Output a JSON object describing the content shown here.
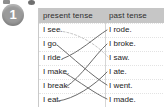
{
  "exercise": {
    "number": "1"
  },
  "table": {
    "columns": [
      {
        "key": "present",
        "label": "present tense"
      },
      {
        "key": "past",
        "label": "past tense"
      }
    ],
    "rows": [
      {
        "present": "I see.",
        "past": "I rode."
      },
      {
        "present": "I go.",
        "past": "I broke."
      },
      {
        "present": "I ride.",
        "past": "I saw."
      },
      {
        "present": "I make.",
        "past": "I ate."
      },
      {
        "present": "I break.",
        "past": "I went."
      },
      {
        "present": "I eat.",
        "past": "I made."
      }
    ]
  },
  "matches": [
    {
      "from": "I see.",
      "to": "I saw.",
      "style": "faint"
    },
    {
      "from": "I go.",
      "to": "I went.",
      "style": "solid"
    },
    {
      "from": "I ride.",
      "to": "I rode.",
      "style": "solid"
    },
    {
      "from": "I make.",
      "to": "I made.",
      "style": "solid"
    },
    {
      "from": "I break.",
      "to": "I broke.",
      "style": "solid"
    },
    {
      "from": "I eat.",
      "to": "I ate.",
      "style": "solid"
    }
  ],
  "colors": {
    "header_band": "#c6c6c6",
    "badge": "#9a9a9a",
    "line": "#6b6b6b",
    "line_faint": "#c2c2c2",
    "text": "#1d1d1d"
  }
}
